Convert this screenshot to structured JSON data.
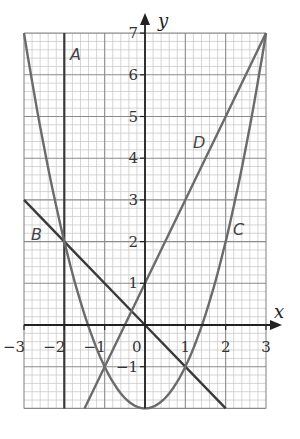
{
  "chart_data": {
    "type": "line",
    "title": "",
    "xlabel": "x",
    "ylabel": "y",
    "xlim": [
      -3,
      3
    ],
    "ylim": [
      -2,
      7
    ],
    "grid": true,
    "grid_minor_step": 0.2,
    "x_ticks": [
      "−3",
      "−2",
      "−1",
      "0",
      "1",
      "2",
      "3"
    ],
    "y_ticks": [
      "−1",
      "1",
      "2",
      "3",
      "4",
      "5",
      "6",
      "7"
    ],
    "series": [
      {
        "name": "A",
        "equation": "x = -2",
        "points": [
          [
            -2,
            -2
          ],
          [
            -2,
            7
          ]
        ]
      },
      {
        "name": "B",
        "equation": "y = -x",
        "points": [
          [
            -3,
            3
          ],
          [
            -2,
            2
          ],
          [
            0,
            0
          ],
          [
            1,
            -1
          ],
          [
            2,
            -2
          ]
        ]
      },
      {
        "name": "C",
        "equation": "y = x^2 - 2",
        "points": [
          [
            -3,
            7
          ],
          [
            -2,
            2
          ],
          [
            -1,
            -1
          ],
          [
            0,
            -2
          ],
          [
            1,
            -1
          ],
          [
            2,
            2
          ],
          [
            3,
            7
          ]
        ]
      },
      {
        "name": "D",
        "equation": "y = 2x + 1",
        "points": [
          [
            -1.5,
            -2
          ],
          [
            -1,
            -1
          ],
          [
            0,
            1
          ],
          [
            1,
            3
          ],
          [
            2,
            5
          ],
          [
            3,
            7
          ]
        ]
      }
    ],
    "annotations": [
      {
        "text": "A",
        "x": -1.7,
        "y": 6.6
      },
      {
        "text": "B",
        "x": -2.75,
        "y": 2.2
      },
      {
        "text": "C",
        "x": 2.25,
        "y": 2.3
      },
      {
        "text": "D",
        "x": 1.35,
        "y": 4.3
      }
    ]
  },
  "labels": {
    "x_axis": "x",
    "y_axis": "y",
    "origin": "0",
    "curve_A": "A",
    "curve_B": "B",
    "curve_C": "C",
    "curve_D": "D"
  }
}
